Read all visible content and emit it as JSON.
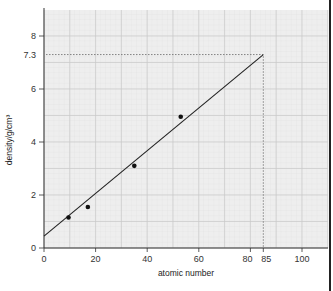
{
  "chart_data": {
    "type": "scatter",
    "title": "",
    "xlabel": "atomic number",
    "ylabel": "density/g/cm³",
    "xlim": [
      0,
      110
    ],
    "ylim": [
      0,
      9
    ],
    "x_ticks": [
      0,
      20,
      40,
      60,
      80,
      85,
      100
    ],
    "x_tick_labels": [
      "0",
      "20",
      "40",
      "60",
      "80",
      "85",
      "100"
    ],
    "y_ticks": [
      0,
      2,
      4,
      6,
      7.3,
      8
    ],
    "y_tick_labels": [
      "0",
      "2",
      "4",
      "6",
      "7.3",
      "8"
    ],
    "grid": true,
    "series": [
      {
        "name": "data points",
        "x": [
          9.5,
          17,
          35,
          53
        ],
        "y": [
          1.15,
          1.55,
          3.1,
          4.95
        ]
      }
    ],
    "best_fit_line": {
      "x": [
        0,
        85
      ],
      "y": [
        0.45,
        7.3
      ]
    },
    "annotations": [
      {
        "type": "extrapolation",
        "x": 85,
        "y": 7.3,
        "style": "dotted",
        "text": "85 → 7.3"
      }
    ],
    "colors": {
      "grid_background": "#eeeeee",
      "grid_line": "#d6d6d6",
      "points": "#111111",
      "line": "#222222"
    }
  },
  "labels": {
    "xlabel": "atomic number",
    "ylabel": "density/g/cm³",
    "caption": "Figure"
  }
}
